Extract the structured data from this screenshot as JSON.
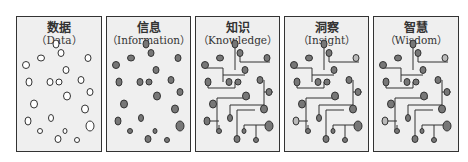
{
  "panels": [
    {
      "id": "data",
      "zh": "数据",
      "en": "（Data）",
      "left": 16,
      "width": 86
    },
    {
      "id": "information",
      "zh": "信息",
      "en": "（Information）",
      "left": 106,
      "width": 85
    },
    {
      "id": "knowledge",
      "zh": "知识",
      "en": "（Knowledge）",
      "left": 195,
      "width": 85
    },
    {
      "id": "insight",
      "zh": "洞察",
      "en": "（Insight）",
      "left": 284,
      "width": 85
    },
    {
      "id": "wisdom",
      "zh": "智慧",
      "en": "（Wisdom）",
      "left": 373,
      "width": 86
    }
  ],
  "colors": {
    "dot_empty": "#ffffff",
    "dot_filled": "#777777",
    "dot_highlight": "#bbbbbb",
    "line": "#333333",
    "panel_bg": "#efefef"
  }
}
